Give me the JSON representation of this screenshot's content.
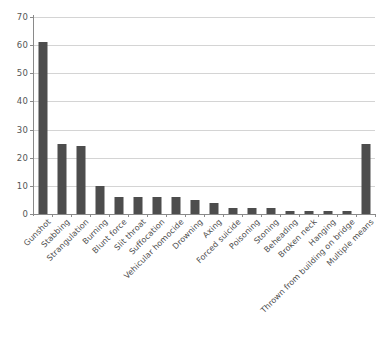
{
  "chart_data": {
    "type": "bar",
    "title": "",
    "subtitle": "",
    "xlabel": "",
    "ylabel": "",
    "ylim": [
      0,
      70
    ],
    "ytick_step": 10,
    "yticks": [
      "0",
      "10",
      "20",
      "30",
      "40",
      "50",
      "60",
      "70"
    ],
    "grid": "horizontal",
    "legend": "none",
    "orientation": "vertical",
    "bar_color": "#4d4d4d",
    "gridline_color": "#d4d4d4",
    "axis_color": "#8a8a8a",
    "categories": [
      "Gunshot",
      "Stabbing",
      "Strangulation",
      "Burning",
      "Blunt force",
      "Slit throat",
      "Suffocation",
      "Vehicular homocide",
      "Drowning",
      "Axing",
      "Forced suicide",
      "Poisoning",
      "Stoning",
      "Beheading",
      "Broken neck",
      "Hanging",
      "Thrown from building on bridge",
      "Multiple means"
    ],
    "values": [
      61,
      25,
      24,
      10,
      6,
      6,
      6,
      6,
      5,
      4,
      2,
      2,
      2,
      1,
      1,
      1,
      1,
      25
    ]
  },
  "footer": {
    "note": ""
  }
}
